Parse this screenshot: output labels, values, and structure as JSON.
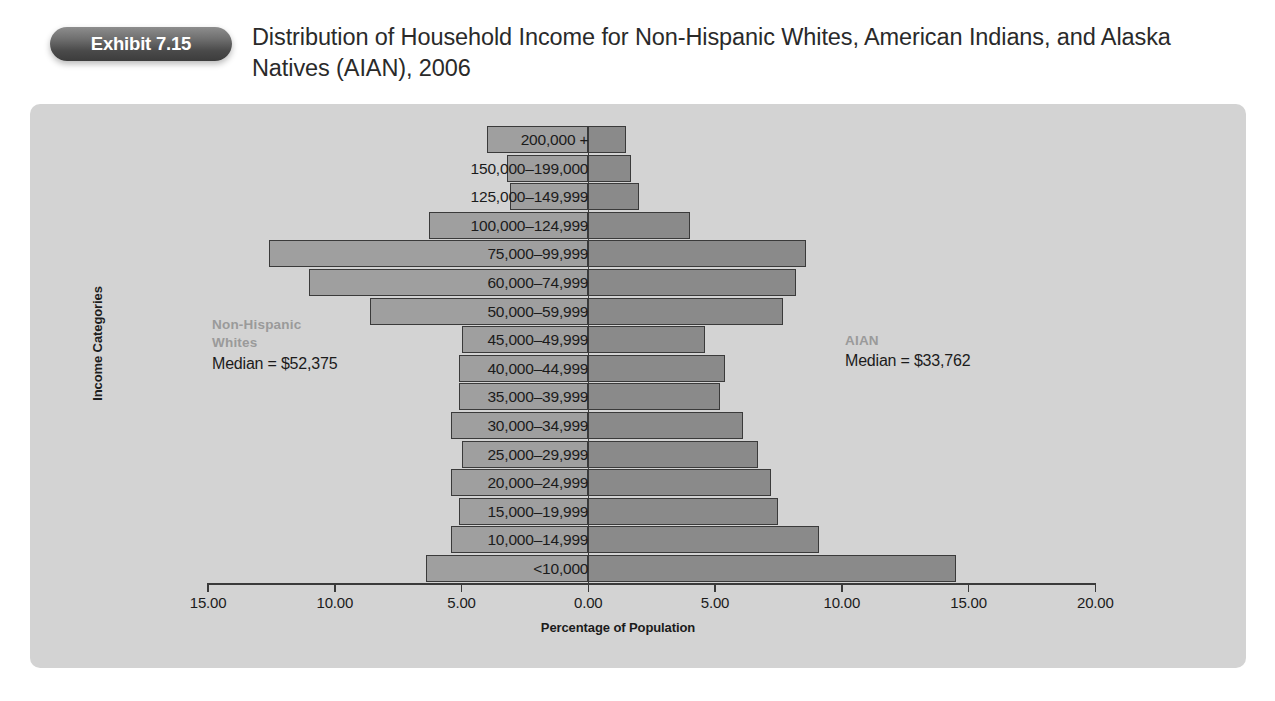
{
  "header": {
    "exhibit_label": "Exhibit 7.15",
    "title": "Distribution of Household Income for Non-Hispanic Whites, American Indians, and Alaska Natives (AIAN), 2006"
  },
  "annotations": {
    "left": {
      "group": "Non-Hispanic\nWhites",
      "group_line1": "Non-Hispanic",
      "group_line2": "Whites",
      "median": "Median = $52,375"
    },
    "right": {
      "group": "AIAN",
      "median": "Median = $33,762"
    }
  },
  "chart_data": {
    "type": "bar",
    "orientation": "horizontal",
    "layout": "population-pyramid",
    "title": "Distribution of Household Income for Non-Hispanic Whites, American Indians, and Alaska Natives (AIAN), 2006",
    "xlabel": "Percentage of Population",
    "ylabel": "Income Categories",
    "xlim": [
      -15.0,
      20.0
    ],
    "xticks": [
      -15.0,
      -10.0,
      -5.0,
      0.0,
      5.0,
      10.0,
      15.0,
      20.0
    ],
    "xtick_labels": [
      "15.00",
      "10.00",
      "5.00",
      "0.00",
      "5.00",
      "10.00",
      "15.00",
      "20.00"
    ],
    "grid": false,
    "legend": "none",
    "colors": {
      "left_bar": "#9f9f9f",
      "right_bar": "#8a8a8a",
      "bar_border": "#3a3a3a",
      "panel": "#d3d3d3"
    },
    "categories": [
      "200,000 +",
      "150,000–199,000",
      "125,000–149,999",
      "100,000–124,999",
      "75,000–99,999",
      "60,000–74,999",
      "50,000–59,999",
      "45,000–49,999",
      "40,000–44,999",
      "35,000–39,999",
      "30,000–34,999",
      "25,000–29,999",
      "20,000–24,999",
      "15,000–19,999",
      "10,000–14,999",
      "<10,000"
    ],
    "series": [
      {
        "name": "Non-Hispanic Whites",
        "side": "left",
        "values": [
          4.0,
          3.2,
          3.1,
          6.3,
          12.6,
          11.0,
          8.6,
          5.0,
          5.1,
          5.1,
          5.4,
          5.0,
          5.4,
          5.1,
          5.4,
          6.4
        ]
      },
      {
        "name": "AIAN",
        "side": "right",
        "values": [
          1.5,
          1.7,
          2.0,
          4.0,
          8.6,
          8.2,
          7.7,
          4.6,
          5.4,
          5.2,
          6.1,
          6.7,
          7.2,
          7.5,
          9.1,
          14.5
        ]
      }
    ]
  }
}
